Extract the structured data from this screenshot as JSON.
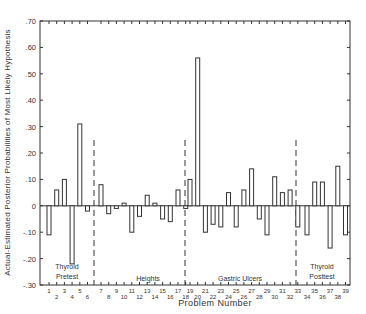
{
  "chart_data": {
    "type": "bar",
    "title": "",
    "xlabel": "Problem Number",
    "ylabel": "Actual-Estimated Posterior Probabilities of Most Likely Hypothesis",
    "ylim": [
      -0.3,
      0.7
    ],
    "yticks": [
      0.7,
      0.6,
      0.5,
      0.4,
      0.3,
      0.2,
      0.1,
      0,
      -0.1,
      -0.2,
      -0.3
    ],
    "ytick_labels": [
      ".70",
      ".60",
      ".50",
      ".40",
      ".30",
      ".20",
      ".10",
      "0",
      "-.10",
      "-.20",
      "-.30"
    ],
    "grid": false,
    "legend": null,
    "groups": [
      {
        "name": "Thyroid Pretest",
        "label_lines": [
          "Thyroid",
          "Pretest"
        ],
        "problems": [
          1,
          2,
          3,
          4,
          5,
          6
        ],
        "values": [
          -0.11,
          0.06,
          0.1,
          -0.22,
          0.31,
          -0.02
        ]
      },
      {
        "name": "Heights",
        "label_lines": [
          "Heights"
        ],
        "problems": [
          7,
          8,
          9,
          10,
          11,
          12,
          13,
          14,
          15,
          16,
          17,
          18
        ],
        "values": [
          0.08,
          -0.03,
          -0.01,
          0.01,
          -0.1,
          -0.04,
          0.04,
          0.01,
          -0.05,
          -0.06,
          0.06,
          -0.01
        ]
      },
      {
        "name": "Gastric Ulcers",
        "label_lines": [
          "Gastric Ulcers"
        ],
        "problems": [
          19,
          20,
          21,
          22,
          23,
          24,
          25,
          26,
          27,
          28,
          29,
          30,
          31,
          32,
          33
        ],
        "values": [
          0.1,
          0.56,
          -0.1,
          -0.07,
          -0.08,
          0.05,
          -0.08,
          0.06,
          0.14,
          -0.05,
          -0.11,
          0.11,
          0.05,
          0.06,
          -0.08
        ]
      },
      {
        "name": "Thyroid Posttest",
        "label_lines": [
          "Thyroid",
          "Posttest"
        ],
        "problems": [
          34,
          35,
          36,
          37,
          38,
          39
        ],
        "values": [
          -0.11,
          0.09,
          0.09,
          -0.16,
          0.15,
          -0.11
        ]
      }
    ]
  },
  "labels": {
    "xlabel": "Problem Number",
    "ylabel": "Actual-Estimated Posterior Probabilities of Most Likely Hypothesis"
  }
}
